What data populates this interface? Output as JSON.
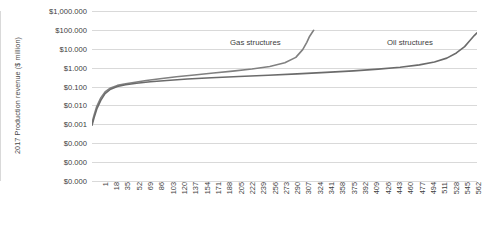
{
  "chart_data": {
    "type": "line",
    "title": "",
    "xlabel": "",
    "ylabel": "2017 Production revenue ($ million)",
    "y_scale": "log",
    "grid": true,
    "legend_position": "inline-annotation",
    "y_tick_labels": [
      "$1,000.000",
      "$100.000",
      "$10.000",
      "$1.000",
      "$0.100",
      "$0.010",
      "$0.001",
      "$0.000",
      "$0.000",
      "$0.000"
    ],
    "y_tick_values": [
      1000,
      100,
      10,
      1,
      0.1,
      0.01,
      0.001,
      0.0001,
      1e-05,
      1e-06
    ],
    "ylim": [
      1e-06,
      1000
    ],
    "x_tick_labels": [
      "1",
      "18",
      "35",
      "52",
      "69",
      "86",
      "103",
      "120",
      "137",
      "154",
      "171",
      "188",
      "205",
      "222",
      "239",
      "256",
      "273",
      "290",
      "307",
      "324",
      "341",
      "358",
      "375",
      "392",
      "409",
      "426",
      "443",
      "460",
      "477",
      "494",
      "511",
      "528",
      "545",
      "562"
    ],
    "xlim": [
      1,
      562
    ],
    "series": [
      {
        "name": "Gas structures",
        "color": "#808080",
        "annotation": "Gas structures",
        "x": [
          1,
          4,
          8,
          14,
          20,
          28,
          38,
          50,
          64,
          80,
          100,
          124,
          150,
          178,
          206,
          234,
          260,
          282,
          298,
          308,
          314,
          318,
          322,
          324
        ],
        "values": [
          0.0012,
          0.003,
          0.009,
          0.026,
          0.052,
          0.085,
          0.115,
          0.14,
          0.17,
          0.21,
          0.26,
          0.33,
          0.41,
          0.52,
          0.66,
          0.85,
          1.15,
          1.8,
          3.5,
          9.0,
          22.0,
          45.0,
          75.0,
          95.0
        ]
      },
      {
        "name": "Oil structures",
        "color": "#6b6b6b",
        "annotation": "Oil structures",
        "x": [
          1,
          4,
          8,
          14,
          20,
          28,
          38,
          50,
          66,
          86,
          110,
          140,
          175,
          215,
          258,
          300,
          342,
          382,
          418,
          450,
          478,
          500,
          518,
          532,
          544,
          552,
          558,
          562
        ],
        "values": [
          0.0009,
          0.0022,
          0.0065,
          0.019,
          0.042,
          0.072,
          0.1,
          0.125,
          0.15,
          0.18,
          0.21,
          0.25,
          0.29,
          0.34,
          0.4,
          0.47,
          0.56,
          0.68,
          0.84,
          1.05,
          1.4,
          2.0,
          3.2,
          6.0,
          13.0,
          28.0,
          50.0,
          70.0
        ]
      }
    ]
  }
}
